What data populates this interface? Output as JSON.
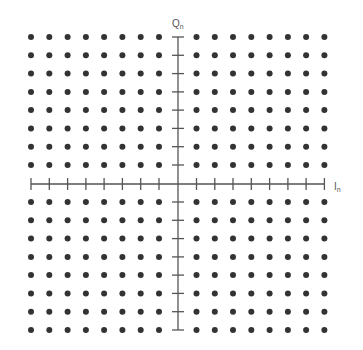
{
  "diagram": {
    "type": "constellation",
    "title": "",
    "x_axis": {
      "label": "I",
      "subscript": "n",
      "label_position": {
        "x": 334,
        "y": 190
      }
    },
    "y_axis": {
      "label": "Q",
      "subscript": "n",
      "label_position": {
        "x": 172,
        "y": 27
      }
    },
    "origin": {
      "x": 178,
      "y": 184
    },
    "axis_extent": {
      "x_min": 31,
      "x_max": 324,
      "y_min": 37,
      "y_max": 330
    },
    "columns_x": [
      31,
      49.3,
      67.6,
      85.9,
      104.1,
      122.4,
      140.7,
      159,
      196.5,
      214.8,
      233,
      251.3,
      269.6,
      287.9,
      306.1,
      324.4
    ],
    "rows_y": [
      37,
      55.3,
      73.6,
      91.9,
      110.1,
      128.4,
      146.7,
      165,
      202,
      220.3,
      238.6,
      256.9,
      275.1,
      293.4,
      311.7,
      330
    ],
    "grid_size": {
      "columns": 16,
      "rows": 16
    },
    "total_points": 256,
    "colors": {
      "dot": "#333333",
      "axis": "#555555",
      "label": "#555555",
      "background": "#ffffff"
    },
    "dot_radius": 3,
    "tick_half_length": 6
  }
}
